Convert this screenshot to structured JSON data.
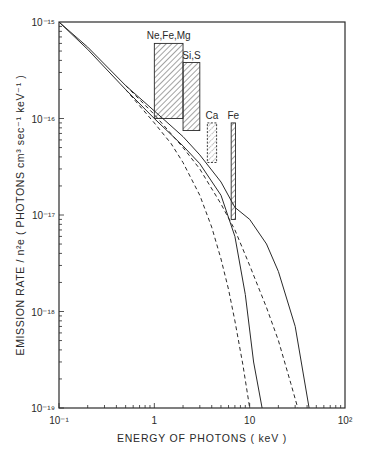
{
  "chart_data": {
    "type": "line",
    "title": "",
    "xlabel": "ENERGY  OF  PHOTONS  ( keV )",
    "ylabel": "EMISSION   RATE / n²e ( PHOTONS  cm³ sec⁻¹ keV⁻¹ )",
    "xscale": "log",
    "yscale": "log",
    "xlim": [
      0.1,
      100
    ],
    "ylim": [
      1e-19,
      1e-15
    ],
    "grid": false,
    "x_tick_labels": [
      "10⁻¹",
      "1",
      "10",
      "10²"
    ],
    "y_tick_labels": [
      "10⁻¹⁵",
      "10⁻¹⁶",
      "10⁻¹⁷",
      "10⁻¹⁸",
      "10⁻¹⁹"
    ],
    "series": [
      {
        "name": "continuum-solid-A",
        "style": "solid",
        "x": [
          0.1,
          0.2,
          0.5,
          1.0,
          2.0,
          3.0,
          5.0,
          7.0,
          9.0,
          11.0,
          13.5
        ],
        "y": [
          1e-15,
          5.2e-16,
          2e-16,
          1e-16,
          5.2e-17,
          3.4e-17,
          1.6e-17,
          6e-18,
          1.5e-18,
          3e-19,
          1e-19
        ]
      },
      {
        "name": "continuum-solid-B",
        "style": "solid",
        "x": [
          0.1,
          0.2,
          0.5,
          1.0,
          2.0,
          3.0,
          5.0,
          7.0,
          10.0,
          15.0,
          20.0,
          30.0,
          42.0
        ],
        "y": [
          1e-15,
          5.5e-16,
          2.2e-16,
          1.2e-16,
          6.5e-17,
          4.2e-17,
          2.2e-17,
          1.2e-17,
          9e-18,
          5e-18,
          2.6e-18,
          7e-19,
          1e-19
        ]
      },
      {
        "name": "continuum-dashed-A",
        "style": "dashed",
        "x": [
          0.5,
          1.0,
          1.5,
          2.0,
          3.0,
          4.0,
          5.0,
          6.0,
          7.0,
          8.5,
          10.0
        ],
        "y": [
          2e-16,
          9e-17,
          5.5e-17,
          3.5e-17,
          1.6e-17,
          7.5e-18,
          3.5e-18,
          1.7e-18,
          8e-19,
          2.8e-19,
          1e-19
        ]
      },
      {
        "name": "continuum-dashed-B",
        "style": "dashed",
        "x": [
          0.5,
          1.0,
          2.0,
          3.0,
          5.0,
          7.0,
          10.0,
          15.0,
          20.0,
          27.0,
          32.0
        ],
        "y": [
          2.2e-16,
          1.1e-16,
          5e-17,
          3e-17,
          1.3e-17,
          7e-18,
          3e-18,
          1.1e-18,
          5e-19,
          1.8e-19,
          1e-19
        ]
      }
    ],
    "annotations": [
      {
        "label": "Ne,Fe,Mg",
        "x_range_keV": [
          1.0,
          2.0
        ],
        "top": 6e-16,
        "fill": "hatched"
      },
      {
        "label": "Si,S",
        "x_range_keV": [
          2.0,
          3.0
        ],
        "top": 3.8e-16,
        "fill": "hatched"
      },
      {
        "label": "Ca",
        "x_range_keV": [
          3.6,
          4.5
        ],
        "top": 9e-17,
        "fill": "dotted-hatched"
      },
      {
        "label": "Fe",
        "x_range_keV": [
          6.4,
          7.1
        ],
        "top": 9e-17,
        "fill": "hatched"
      }
    ]
  },
  "labels": {
    "xlabel": "ENERGY  OF  PHOTONS  ( keV )",
    "ylabel": "EMISSION   RATE / n²e ( PHOTONS  cm³ sec⁻¹ keV⁻¹ )"
  },
  "colors": {
    "ink": "#2a2a2a",
    "background": "#ffffff"
  }
}
